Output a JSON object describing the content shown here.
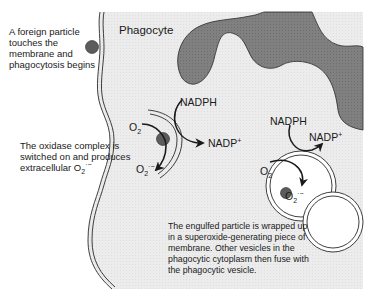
{
  "colors": {
    "cytoplasm": "#ececec",
    "nucleus": "#7d7d7d",
    "particle": "#5c5c5c",
    "membrane": "#2a2a2a",
    "background": "#ffffff"
  },
  "labels": {
    "phagocyte": "Phagocyte",
    "step1": [
      "A foreign particle",
      "touches the",
      "membrane and",
      "phagocytosis begins"
    ],
    "step2_line1": "The oxidase complex is",
    "step2_line2": "switched on and produces",
    "step2_line3_prefix": "extracellular O",
    "step2_sub": "2",
    "step2_sup": "·−",
    "step3": [
      "The engulfed particle is wrapped up",
      "in a superoxide-generating piece of",
      "membrane. Other vesicles in the",
      "phagocytic cytoplasm then fuse with",
      "the phagocytic vesicle."
    ]
  },
  "reactions": {
    "membrane_reaction": {
      "substrate": "NADPH",
      "product_base": "NADP",
      "product_sup": "+",
      "oxygen_base": "O",
      "oxygen_sub": "2",
      "superoxide_base": "O",
      "superoxide_sub": "2",
      "superoxide_sup": "·−"
    },
    "vesicle_reaction": {
      "substrate": "NADPH",
      "product_base": "NADP",
      "product_sup": "+",
      "oxygen_base": "O",
      "oxygen_sub": "2",
      "superoxide_base": "O",
      "superoxide_sub": "2",
      "superoxide_sup": "·−"
    }
  },
  "icons": {
    "foreign_particle": "filled-circle",
    "nucleus": "lobed-shape",
    "phagocytic_vesicle": "double-circle",
    "fusing_vesicle": "double-circle",
    "reaction_arrow": "curved-arrow"
  }
}
